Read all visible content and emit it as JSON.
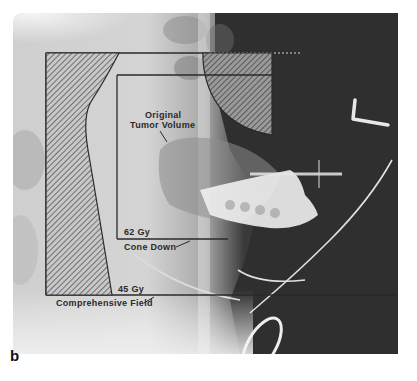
{
  "figure": {
    "panel_label": "b",
    "annotations": {
      "tumor": "Original\nTumor Volume",
      "tumor_line1": "Original",
      "tumor_line2": "Tumor Volume",
      "cone_dose": "62 Gy",
      "cone_label": "Cone Down",
      "field_dose": "45 Gy",
      "field_label": "Comprehensive Field"
    },
    "colors": {
      "background": "#ffffff",
      "xray_light": "#d6d6d6",
      "xray_dark": "#2e2e2e",
      "field_line": "#2a2a2a",
      "hatch": "#555555"
    }
  }
}
